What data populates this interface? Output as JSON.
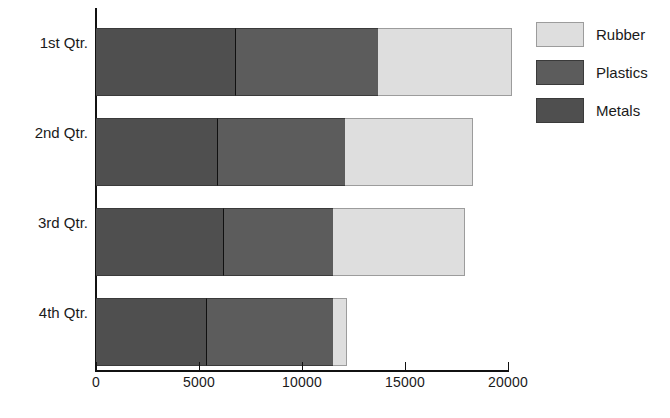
{
  "chart_data": {
    "type": "bar",
    "orientation": "horizontal",
    "stacked": true,
    "title": "",
    "xlabel": "",
    "ylabel": "",
    "categories": [
      "1st Qtr.",
      "2nd Qtr.",
      "3rd Qtr.",
      "4th Qtr."
    ],
    "series": [
      {
        "name": "Metals",
        "color": "#4f4f4f",
        "values": [
          6800,
          5900,
          6200,
          5400
        ]
      },
      {
        "name": "Plastics",
        "color": "#5c5c5c",
        "values": [
          6900,
          6200,
          5300,
          6100
        ]
      },
      {
        "name": "Rubber",
        "color": "#dedede",
        "values": [
          6500,
          6200,
          6400,
          700
        ]
      }
    ],
    "totals": [
      20200,
      18300,
      17900,
      12200
    ],
    "xlim": [
      0,
      20000
    ],
    "xticks": [
      0,
      5000,
      10000,
      15000,
      20000
    ],
    "xtick_labels": [
      "0",
      "5000",
      "10000",
      "15000",
      "20000"
    ],
    "grid": false,
    "legend": {
      "position": "top-right",
      "entries": [
        {
          "label": "Rubber",
          "color": "#dedede"
        },
        {
          "label": "Plastics",
          "color": "#5c5c5c"
        },
        {
          "label": "Metals",
          "color": "#4f4f4f"
        }
      ]
    }
  },
  "axis": {
    "x_tick_labels": [
      "0",
      "5000",
      "10000",
      "15000",
      "20000"
    ],
    "y_tick_labels": [
      "1st Qtr.",
      "2nd Qtr.",
      "3rd Qtr.",
      "4th Qtr."
    ]
  },
  "legend": {
    "items": [
      {
        "label": "Rubber"
      },
      {
        "label": "Plastics"
      },
      {
        "label": "Metals"
      }
    ]
  }
}
